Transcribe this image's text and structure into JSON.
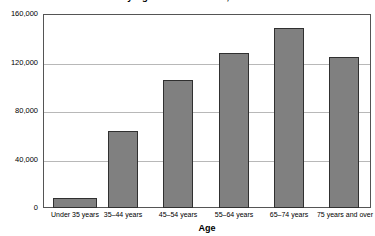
{
  "chart_data": {
    "type": "bar",
    "title": "by Age of Householder, 1998",
    "xlabel": "Age",
    "ylabel": "",
    "categories": [
      "Under 35 years",
      "35–44 years",
      "45–54 years",
      "55–64 years",
      "65–74 years",
      "75 years and over"
    ],
    "values": [
      8200,
      63500,
      105600,
      127800,
      148500,
      124500
    ],
    "ylim": [
      0,
      160000
    ],
    "ytick_labels": [
      "0",
      "40,000",
      "80,000",
      "120,000",
      "160,000"
    ],
    "ytick_values": [
      0,
      40000,
      80000,
      120000,
      160000
    ],
    "grid": true,
    "legend": "none",
    "bar_color": "#808080",
    "bar_border_color": "#303030",
    "grid_color": "#b8b8b8",
    "axis_color": "#555555",
    "background": "#ffffff"
  }
}
